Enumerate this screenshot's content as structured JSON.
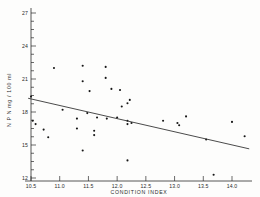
{
  "chart_data": {
    "type": "scatter",
    "title": "",
    "xlabel": "CONDITION  INDEX",
    "ylabel": "N P N  mg / 100 ml",
    "xlim": [
      10.45,
      14.3
    ],
    "ylim": [
      12,
      27
    ],
    "grid": false,
    "legend": null,
    "xticks": [
      10.5,
      11.0,
      11.5,
      12.0,
      12.5,
      13.0,
      13.5,
      14.0
    ],
    "xtick_labels": [
      "10.5",
      "11.0",
      "11.5",
      "12.0",
      "12.5",
      "13.0",
      "13.5",
      "14.0"
    ],
    "yticks": [
      12,
      15,
      18,
      21,
      24,
      27
    ],
    "ytick_labels": [
      "12",
      "15",
      "18",
      "21",
      "24",
      "27"
    ],
    "y_minor_tick_step": 0.75,
    "points": [
      {
        "x": 10.5,
        "y": 19.4
      },
      {
        "x": 10.53,
        "y": 17.2
      },
      {
        "x": 10.58,
        "y": 16.9
      },
      {
        "x": 10.72,
        "y": 16.4
      },
      {
        "x": 10.8,
        "y": 15.7
      },
      {
        "x": 10.9,
        "y": 22.0
      },
      {
        "x": 11.05,
        "y": 18.2
      },
      {
        "x": 11.3,
        "y": 17.4
      },
      {
        "x": 11.3,
        "y": 16.5
      },
      {
        "x": 11.4,
        "y": 22.2
      },
      {
        "x": 11.4,
        "y": 20.8
      },
      {
        "x": 11.4,
        "y": 14.5
      },
      {
        "x": 11.48,
        "y": 17.9
      },
      {
        "x": 11.52,
        "y": 19.9
      },
      {
        "x": 11.6,
        "y": 16.3
      },
      {
        "x": 11.6,
        "y": 15.9
      },
      {
        "x": 11.65,
        "y": 17.5
      },
      {
        "x": 11.8,
        "y": 22.1
      },
      {
        "x": 11.8,
        "y": 21.1
      },
      {
        "x": 11.82,
        "y": 17.4
      },
      {
        "x": 11.9,
        "y": 20.1
      },
      {
        "x": 12.0,
        "y": 17.5
      },
      {
        "x": 12.05,
        "y": 20.0
      },
      {
        "x": 12.08,
        "y": 18.5
      },
      {
        "x": 12.18,
        "y": 18.8
      },
      {
        "x": 12.18,
        "y": 17.2
      },
      {
        "x": 12.18,
        "y": 16.9
      },
      {
        "x": 12.18,
        "y": 13.6
      },
      {
        "x": 12.22,
        "y": 19.1
      },
      {
        "x": 12.25,
        "y": 17.0
      },
      {
        "x": 12.8,
        "y": 17.2
      },
      {
        "x": 13.05,
        "y": 17.0
      },
      {
        "x": 13.08,
        "y": 16.8
      },
      {
        "x": 13.2,
        "y": 17.6
      },
      {
        "x": 13.55,
        "y": 15.5
      },
      {
        "x": 13.68,
        "y": 12.3
      },
      {
        "x": 14.0,
        "y": 17.1
      },
      {
        "x": 14.22,
        "y": 15.8
      }
    ],
    "fit_line": {
      "label": "regression line",
      "x_start": 10.45,
      "y_start": 19.25,
      "x_end": 14.3,
      "y_end": 14.65
    }
  }
}
